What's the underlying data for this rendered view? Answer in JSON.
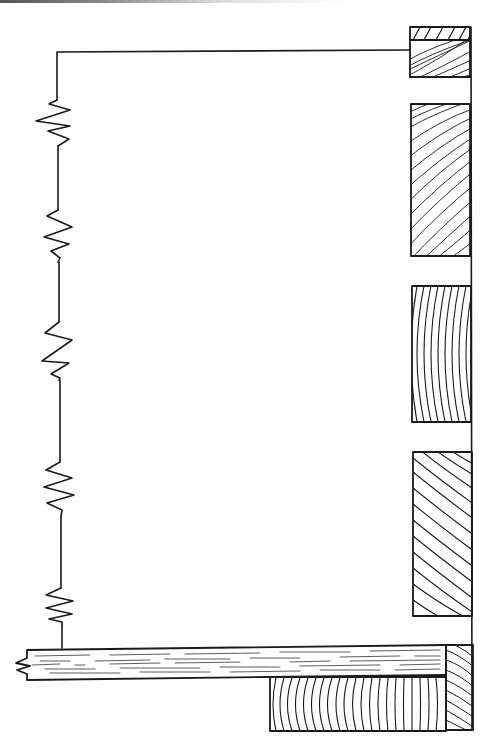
{
  "diagram": {
    "type": "hand-drawn technical illustration",
    "ink_color": "#1a1a1a",
    "background": "#ffffff",
    "circuit": {
      "wire_top": {
        "x1": 57,
        "y1": 51,
        "x2": 410,
        "y2": 51
      },
      "wire_left_x": 58,
      "resistor_count": 5,
      "resistors": [
        {
          "id": "R1",
          "y_start": 100,
          "y_end": 146
        },
        {
          "id": "R2",
          "y_start": 210,
          "y_end": 262
        },
        {
          "id": "R3",
          "y_start": 322,
          "y_end": 380
        },
        {
          "id": "R4",
          "y_start": 462,
          "y_end": 516
        },
        {
          "id": "R5",
          "y_start": 588,
          "y_end": 624
        }
      ]
    },
    "blocks": [
      {
        "id": "top-block",
        "x": 410,
        "y": 27,
        "w": 60,
        "h": 50,
        "grain": "diagonal",
        "has_cap_strip": true
      },
      {
        "id": "block-2",
        "x": 411,
        "y": 104,
        "w": 59,
        "h": 152,
        "grain": "diagonal-curved"
      },
      {
        "id": "block-3",
        "x": 412,
        "y": 286,
        "w": 59,
        "h": 136,
        "grain": "vertical-arcs"
      },
      {
        "id": "block-4",
        "x": 413,
        "y": 452,
        "w": 59,
        "h": 164,
        "grain": "diagonal-arcs"
      }
    ],
    "plank": {
      "x": 27,
      "y": 648,
      "w": 419,
      "h": 30,
      "grain": "longitudinal",
      "left_end": "broken"
    },
    "bottom_block": {
      "x": 270,
      "y": 675,
      "w": 176,
      "h": 56,
      "grain": "vertical-arcs"
    },
    "corner_post": {
      "x": 446,
      "y": 645,
      "w": 27,
      "h": 85,
      "grain": "diagonal-arcs"
    },
    "right_rail": {
      "x": 471,
      "y1": 27,
      "y2": 730
    }
  }
}
